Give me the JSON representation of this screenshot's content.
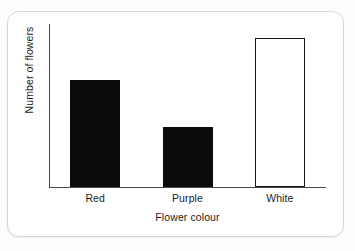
{
  "chart_data": {
    "type": "bar",
    "title": "",
    "xlabel": "Flower colour",
    "ylabel": "Number of flowers",
    "categories": [
      "Red",
      "Purple",
      "White"
    ],
    "values": [
      36,
      20,
      50
    ],
    "ylim": [
      0,
      55
    ],
    "grid": false,
    "legend": null,
    "axis_tick_labels": {
      "y": [],
      "x": [
        "Red",
        "Purple",
        "White"
      ]
    },
    "bar_styles": [
      {
        "category": "Red",
        "fill": "#0b0b0b",
        "stroke": "#0b0b0b",
        "style": "filled"
      },
      {
        "category": "Purple",
        "fill": "#0b0b0b",
        "stroke": "#0b0b0b",
        "style": "filled"
      },
      {
        "category": "White",
        "fill": "#ffffff",
        "stroke": "#151515",
        "style": "outlined"
      }
    ],
    "annotations": []
  },
  "figure": {
    "background_color": "#ffffff",
    "border_color": "#d8d8d8",
    "axis_color": "#4a4a4a",
    "text_color": "#1c1c1c"
  }
}
